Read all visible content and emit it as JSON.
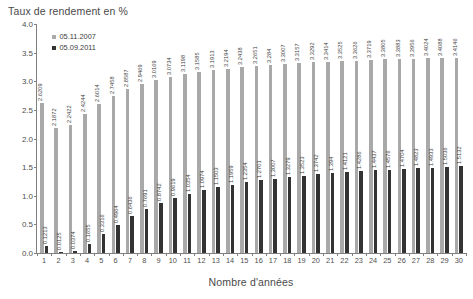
{
  "chart_data": {
    "type": "bar",
    "title": "Taux de rendement en %",
    "subtitle": "",
    "xlabel": "Nombre d'années",
    "ylabel": "",
    "ylim": [
      0.0,
      4.0
    ],
    "ytick_labels": [
      "0.0",
      "0.5",
      "1.0",
      "1.5",
      "2.0",
      "2.5",
      "3.0",
      "3.5",
      "4.0"
    ],
    "ytick_values": [
      0.0,
      0.5,
      1.0,
      1.5,
      2.0,
      2.5,
      3.0,
      3.5,
      4.0
    ],
    "grid": false,
    "legend_position": "upper-left-inside",
    "categories": [
      1,
      2,
      3,
      4,
      5,
      6,
      7,
      8,
      9,
      10,
      11,
      12,
      13,
      14,
      15,
      16,
      17,
      18,
      19,
      20,
      21,
      22,
      23,
      24,
      25,
      26,
      27,
      28,
      29,
      30
    ],
    "series": [
      {
        "name": "05.11.2007",
        "color": "#a9a9a9",
        "values": [
          2.6209,
          2.1872,
          2.2422,
          2.4244,
          2.6014,
          2.7458,
          2.8587,
          2.9469,
          3.0169,
          3.0734,
          3.1198,
          3.1585,
          3.1913,
          3.2194,
          3.2438,
          3.2651,
          3.284,
          3.3007,
          3.3157,
          3.3292,
          3.3414,
          3.3525,
          3.3626,
          3.3719,
          3.3805,
          3.3883,
          3.3956,
          3.4024,
          3.4088,
          3.4146
        ],
        "labels": [
          "2.6209",
          "2.1872",
          "2.2422",
          "2.4244",
          "2.6014",
          "2.7458",
          "2.8587",
          "2.9469",
          "3.0169",
          "3.0734",
          "3.1198",
          "3.1585",
          "3.1913",
          "3.2194",
          "3.2438",
          "3.2651",
          "3.284",
          "3.3007",
          "3.3157",
          "3.3292",
          "3.3414",
          "3.3525",
          "3.3626",
          "3.3719",
          "3.3805",
          "3.3883",
          "3.3956",
          "3.4024",
          "3.4088",
          "3.4146"
        ]
      },
      {
        "name": "05.09.2011",
        "color": "#333333",
        "values": [
          0.1213,
          0.0125,
          0.0374,
          0.1655,
          0.3316,
          0.4964,
          0.6436,
          0.7691,
          0.8742,
          0.9619,
          1.0354,
          1.0974,
          1.1503,
          1.1959,
          1.2354,
          1.2701,
          1.3007,
          1.3279,
          1.3523,
          1.3742,
          1.394,
          1.4121,
          1.4286,
          1.4437,
          1.4576,
          1.4704,
          1.4823,
          1.4933,
          1.5036,
          1.5132
        ],
        "labels": [
          "0.1213",
          "0.0125",
          "0.0374",
          "0.1655",
          "0.3316",
          "0.4964",
          "0.6436",
          "0.7691",
          "0.8742",
          "0.9619",
          "1.0354",
          "1.0974",
          "1.1503",
          "1.1959",
          "1.2354",
          "1.2701",
          "1.3007",
          "1.3279",
          "1.3523",
          "1.3742",
          "1.394",
          "1.4121",
          "1.4286",
          "1.4437",
          "1.4576",
          "1.4704",
          "1.4823",
          "1.4933",
          "1.5036",
          "1.5132"
        ]
      }
    ]
  },
  "legend": {
    "items": [
      {
        "label": "05.11.2007",
        "color": "#a9a9a9"
      },
      {
        "label": "05.09.2011",
        "color": "#333333"
      }
    ]
  },
  "axis_colors": {
    "axis_line": "#808080",
    "tick_text": "#4f4f4f",
    "title_text": "#4a4a4a"
  }
}
